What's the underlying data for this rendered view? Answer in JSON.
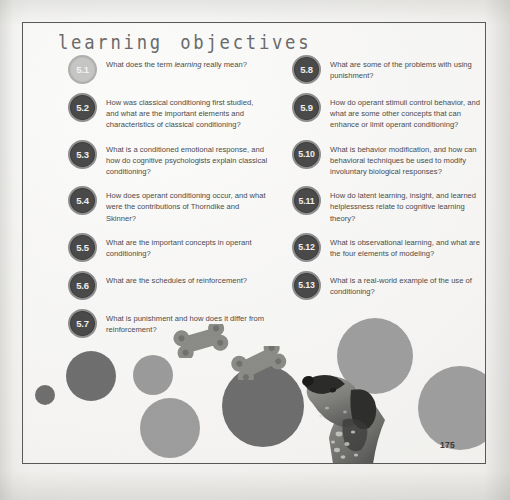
{
  "page": {
    "heading": "learning objectives",
    "page_number": "175",
    "frame_color": "#585858",
    "paper_color": "#f3f2f0",
    "heading_color": "#6b6b6b",
    "text_color": "#4c4c4c"
  },
  "objectives": {
    "left_column": [
      {
        "number": "5.1",
        "style": "light",
        "text_before_italic": "What does the term ",
        "italic": "learning",
        "text_after_italic": " really mean?",
        "full_text": "What does the term learning really mean?"
      },
      {
        "number": "5.2",
        "style": "dark",
        "full_text": "How was classical conditioning first studied, and what are the important elements and characteristics of classical conditioning?"
      },
      {
        "number": "5.3",
        "style": "dark",
        "full_text": "What is a conditioned emotional response, and how do cognitive psychologists explain classical conditioning?"
      },
      {
        "number": "5.4",
        "style": "dark",
        "full_text": "How does operant conditioning occur, and what were the contributions of Thorndike and Skinner?"
      },
      {
        "number": "5.5",
        "style": "dark",
        "full_text": "What are the important concepts in operant conditioning?"
      },
      {
        "number": "5.6",
        "style": "dark",
        "full_text": "What are the schedules of reinforcement?"
      },
      {
        "number": "5.7",
        "style": "dark",
        "full_text": "What is punishment and how does it differ from reinforcement?"
      }
    ],
    "right_column": [
      {
        "number": "5.8",
        "style": "dark",
        "full_text": "What are some of the problems with using punishment?"
      },
      {
        "number": "5.9",
        "style": "dark",
        "full_text": "How do operant stimuli control behavior, and what are some other concepts that can enhance or limit operant conditioning?"
      },
      {
        "number": "5.10",
        "style": "dark",
        "full_text": "What is behavior modification, and how can behavioral techniques be used to modify involuntary biological responses?"
      },
      {
        "number": "5.11",
        "style": "dark",
        "full_text": "How do latent learning, insight, and learned helplessness relate to cognitive learning theory?"
      },
      {
        "number": "5.12",
        "style": "dark",
        "full_text": "What is observational learning, and what are the four elements of modeling?"
      },
      {
        "number": "5.13",
        "style": "dark",
        "full_text": "What is a real-world example of the use of conditioning?"
      }
    ]
  },
  "illustration": {
    "description": "photo collage of grey circles, dog biscuits and a dog looking upward",
    "circles": [
      {
        "name": "circle-small-dark",
        "cx": 22,
        "cy": 77,
        "r": 10,
        "color": "#6f6f6f"
      },
      {
        "name": "circle-medium-dark",
        "cx": 68,
        "cy": 58,
        "r": 25,
        "color": "#6f6f6f"
      },
      {
        "name": "circle-medium-light",
        "cx": 130,
        "cy": 57,
        "r": 20,
        "color": "#9b9b9b"
      },
      {
        "name": "circle-large-light",
        "cx": 147,
        "cy": 110,
        "r": 30,
        "color": "#9d9d9d"
      },
      {
        "name": "circle-large-dark",
        "cx": 240,
        "cy": 88,
        "r": 41,
        "color": "#6e6e6e"
      },
      {
        "name": "circle-upper-light",
        "cx": 352,
        "cy": 38,
        "r": 38,
        "color": "#9e9e9e"
      },
      {
        "name": "circle-right-light",
        "cx": 437,
        "cy": 90,
        "r": 42,
        "color": "#9e9e9e"
      }
    ],
    "bones": [
      {
        "name": "dog-biscuit-left",
        "x": 155,
        "y": 14,
        "rotation": -18,
        "color": "#8a8a8a"
      },
      {
        "name": "dog-biscuit-right",
        "x": 215,
        "y": 38,
        "rotation": -25,
        "color": "#8a8a8a"
      }
    ],
    "dog": {
      "name": "dog-photo",
      "colors": {
        "body": "#8d8d8a",
        "muzzle": "#2c2c2c",
        "patch": "#3a3a38",
        "light": "#d6d5d0"
      }
    }
  }
}
